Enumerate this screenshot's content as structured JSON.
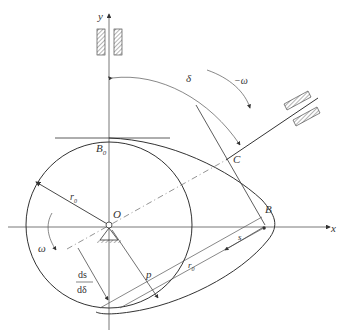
{
  "diagram": {
    "type": "cam-mechanism",
    "colors": {
      "line": "#333333",
      "dashed": "#666666",
      "background": "#ffffff"
    },
    "labels": {
      "y_axis": "y",
      "x_axis": "x",
      "origin": "O",
      "B0": "B",
      "B0_sub": "0",
      "B": "B",
      "C": "C",
      "delta": "δ",
      "neg_omega": "−ω",
      "omega": "ω",
      "r0": "r",
      "r0_sub": "0",
      "r0_alt": "r",
      "r0_alt_sub": "0",
      "s": "s",
      "p": "p",
      "ds_num": "ds",
      "ds_den": "dδ"
    }
  }
}
